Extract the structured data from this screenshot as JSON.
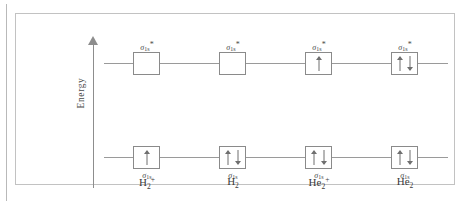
{
  "figure": {
    "energy_axis": {
      "label": "Energy",
      "direction": "up",
      "icon": "up-arrow-icon"
    },
    "orbital_labels": {
      "antibonding": {
        "symbol": "σ",
        "subscript": "1s",
        "superscript": "*"
      },
      "bonding": {
        "symbol": "σ",
        "subscript": "1s",
        "superscript": ""
      }
    },
    "columns": [
      {
        "id": "h2-plus",
        "molecule": {
          "element": "H",
          "subscript": "2",
          "charge": "+"
        },
        "levels": {
          "antibonding": {
            "label_symbol": "σ",
            "label_sub": "1s",
            "label_star": "*",
            "electrons": 0,
            "spins": []
          },
          "bonding": {
            "label_symbol": "σ",
            "label_sub": "1s",
            "label_star": "",
            "electrons": 1,
            "spins": [
              "up"
            ]
          }
        }
      },
      {
        "id": "h2",
        "molecule": {
          "element": "H",
          "subscript": "2",
          "charge": ""
        },
        "levels": {
          "antibonding": {
            "label_symbol": "σ",
            "label_sub": "1s",
            "label_star": "*",
            "electrons": 0,
            "spins": []
          },
          "bonding": {
            "label_symbol": "σ",
            "label_sub": "1s",
            "label_star": "",
            "electrons": 2,
            "spins": [
              "up",
              "down"
            ]
          }
        }
      },
      {
        "id": "he2-plus",
        "molecule": {
          "element": "He",
          "subscript": "2",
          "charge": "+"
        },
        "levels": {
          "antibonding": {
            "label_symbol": "σ",
            "label_sub": "1s",
            "label_star": "*",
            "electrons": 1,
            "spins": [
              "up"
            ]
          },
          "bonding": {
            "label_symbol": "σ",
            "label_sub": "1s",
            "label_star": "",
            "electrons": 2,
            "spins": [
              "up",
              "down"
            ]
          }
        }
      },
      {
        "id": "he2",
        "molecule": {
          "element": "He",
          "subscript": "2",
          "charge": ""
        },
        "levels": {
          "antibonding": {
            "label_symbol": "σ",
            "label_sub": "1s",
            "label_star": "*",
            "electrons": 2,
            "spins": [
              "up",
              "down"
            ]
          },
          "bonding": {
            "label_symbol": "σ",
            "label_sub": "1s",
            "label_star": "",
            "electrons": 2,
            "spins": [
              "up",
              "down"
            ]
          }
        }
      }
    ],
    "colors": {
      "frame": "#c2c2c2",
      "line": "#9a9a9a",
      "box_border": "#8a8a8a",
      "text": "#3a3a3a",
      "axis": "#8d8d8d",
      "background": "#ffffff"
    }
  }
}
